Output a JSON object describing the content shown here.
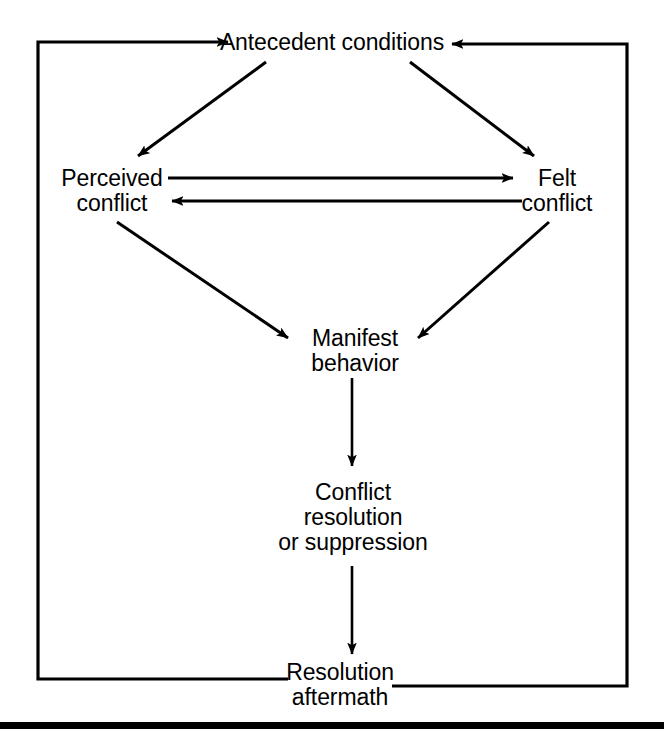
{
  "figure": {
    "type": "process-flow-diagram",
    "background_color": "#ffffff",
    "line_color": "#000000",
    "text_color": "#000000"
  },
  "nodes": [
    {
      "id": "antecedent-conditions",
      "lines": [
        "Antecedent conditions"
      ],
      "center_x": 335,
      "top": 30
    },
    {
      "id": "perceived-conflict",
      "lines": [
        "Perceived",
        "conflict"
      ],
      "center_x": 112,
      "top": 166
    },
    {
      "id": "felt-conflict",
      "lines": [
        "Felt",
        "conflict"
      ],
      "center_x": 557,
      "top": 166
    },
    {
      "id": "manifest-behavior",
      "lines": [
        "Manifest",
        "behavior"
      ],
      "center_x": 355,
      "top": 326
    },
    {
      "id": "conflict-resolution",
      "lines": [
        "Conflict",
        "resolution",
        "or suppression"
      ],
      "center_x": 353,
      "top": 480
    },
    {
      "id": "resolution-aftermath",
      "lines": [
        "Resolution",
        "aftermath"
      ],
      "center_x": 340,
      "top": 660
    }
  ],
  "edges": [
    {
      "id": "antecedent-to-perceived",
      "from": "antecedent-conditions",
      "to": "perceived-conflict",
      "style": "diagonal-arrow",
      "direction": "down-left"
    },
    {
      "id": "antecedent-to-felt",
      "from": "antecedent-conditions",
      "to": "felt-conflict",
      "style": "diagonal-arrow",
      "direction": "down-right"
    },
    {
      "id": "perceived-to-felt",
      "from": "perceived-conflict",
      "to": "felt-conflict",
      "style": "horizontal-arrow",
      "direction": "right"
    },
    {
      "id": "felt-to-perceived",
      "from": "felt-conflict",
      "to": "perceived-conflict",
      "style": "horizontal-arrow",
      "direction": "left"
    },
    {
      "id": "perceived-to-manifest",
      "from": "perceived-conflict",
      "to": "manifest-behavior",
      "style": "diagonal-arrow",
      "direction": "down-right"
    },
    {
      "id": "felt-to-manifest",
      "from": "felt-conflict",
      "to": "manifest-behavior",
      "style": "diagonal-arrow",
      "direction": "down-left"
    },
    {
      "id": "manifest-to-resolution",
      "from": "manifest-behavior",
      "to": "conflict-resolution",
      "style": "vertical-arrow",
      "direction": "down"
    },
    {
      "id": "resolution-to-aftermath",
      "from": "conflict-resolution",
      "to": "resolution-aftermath",
      "style": "vertical-arrow",
      "direction": "down"
    },
    {
      "id": "aftermath-feedback-left",
      "from": "resolution-aftermath",
      "to": "antecedent-conditions",
      "style": "orthogonal-feedback-loop",
      "direction": "left-then-up-then-right"
    },
    {
      "id": "aftermath-feedback-right",
      "from": "resolution-aftermath",
      "to": "antecedent-conditions",
      "style": "orthogonal-feedback-loop",
      "direction": "right-then-up-then-left"
    }
  ]
}
